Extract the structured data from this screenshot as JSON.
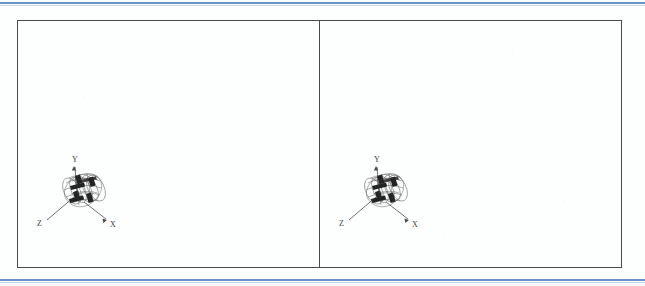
{
  "page": {
    "background_color": "#fdfefe",
    "rule_color": "#6a93c8",
    "frame_color": "#4a4a4a"
  },
  "figure": {
    "panel_count": 2,
    "panels": [
      {
        "id": "left",
        "name": "left-viewport",
        "model": {
          "name": "cylindrical-wireframe-mesh",
          "mesh_color": "#5a5a5a",
          "highlight_color": "#1c1c1c",
          "axes": {
            "x_label": "X",
            "y_label": "Y",
            "z_label": "Z"
          }
        }
      },
      {
        "id": "right",
        "name": "right-viewport",
        "model": {
          "name": "cylindrical-wireframe-mesh",
          "mesh_color": "#5a5a5a",
          "highlight_color": "#1c1c1c",
          "axes": {
            "x_label": "X",
            "y_label": "Y",
            "z_label": "Z"
          }
        }
      }
    ]
  }
}
